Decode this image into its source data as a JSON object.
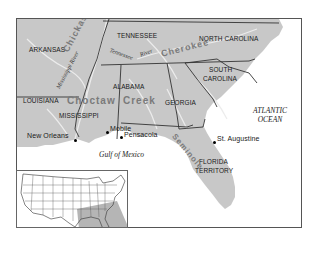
{
  "map": {
    "colors": {
      "land": "#c8c8c8",
      "water": "#ffffff",
      "border": "#333333",
      "river": "#eeeeee",
      "nation_label": "#7a7a7a",
      "inset_highlight": "#b5b5b5"
    },
    "states": [
      {
        "id": "arkansas",
        "label": "ARKANSAS"
      },
      {
        "id": "louisiana",
        "label": "LOUISIANA"
      },
      {
        "id": "mississippi",
        "label": "MISSISSIPPI"
      },
      {
        "id": "tennessee",
        "label": "TENNESSEE"
      },
      {
        "id": "alabama",
        "label": "ALABAMA"
      },
      {
        "id": "georgia",
        "label": "GEORGIA"
      },
      {
        "id": "north_carolina",
        "label": "NORTH CAROLINA"
      },
      {
        "id": "south_carolina_1",
        "label": "SOUTH"
      },
      {
        "id": "south_carolina_2",
        "label": "CAROLINA"
      },
      {
        "id": "florida_1",
        "label": "FLORIDA"
      },
      {
        "id": "florida_2",
        "label": "TERRITORY"
      }
    ],
    "nations": [
      {
        "id": "chickasaw",
        "label": "Chickasaw"
      },
      {
        "id": "choctaw",
        "label": "Choctaw"
      },
      {
        "id": "creek",
        "label": "Creek"
      },
      {
        "id": "cherokee",
        "label": "Cherokee"
      },
      {
        "id": "seminole",
        "label": "Seminole"
      }
    ],
    "rivers": [
      {
        "id": "mississippi_river",
        "label": "Mississippi River"
      },
      {
        "id": "tennessee_river_1",
        "label": "Tennessee"
      },
      {
        "id": "tennessee_river_2",
        "label": "River"
      }
    ],
    "cities": [
      {
        "id": "new_orleans",
        "label": "New Orleans"
      },
      {
        "id": "mobile",
        "label": "Mobile"
      },
      {
        "id": "pensacola",
        "label": "Pensacola"
      },
      {
        "id": "st_augustine",
        "label": "St. Augustine"
      }
    ],
    "water_bodies": [
      {
        "id": "atlantic_1",
        "label": "ATLANTIC"
      },
      {
        "id": "atlantic_2",
        "label": "OCEAN"
      },
      {
        "id": "gulf",
        "label": "Gulf of Mexico"
      }
    ]
  }
}
